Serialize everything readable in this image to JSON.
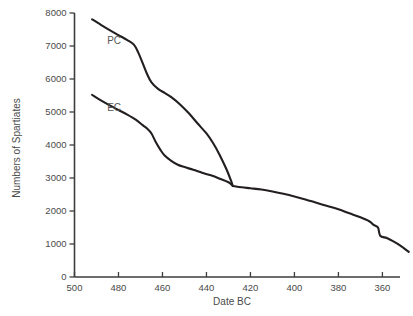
{
  "chart_data": {
    "type": "line",
    "title": "",
    "xlabel": "Date BC",
    "ylabel": "Numbers of Spartiates",
    "xlim": [
      500,
      352
    ],
    "ylim": [
      0,
      8000
    ],
    "x_ticks": [
      500,
      480,
      460,
      440,
      420,
      400,
      380,
      360
    ],
    "y_ticks": [
      0,
      1000,
      2000,
      3000,
      4000,
      5000,
      6000,
      7000,
      8000
    ],
    "x_tick_labels": [
      "500",
      "480",
      "460",
      "440",
      "420",
      "400",
      "380",
      "360"
    ],
    "y_tick_labels": [
      "0",
      "1000",
      "2000",
      "3000",
      "4000",
      "5000",
      "6000",
      "7000",
      "8000"
    ],
    "x_axis_reversed": true,
    "grid": false,
    "legend": "inline-labels",
    "series": [
      {
        "name": "PC",
        "label": "PC",
        "label_x": 482,
        "label_y": 7050,
        "color": "#231f20",
        "points": [
          [
            492,
            7810
          ],
          [
            488,
            7640
          ],
          [
            484,
            7480
          ],
          [
            480,
            7330
          ],
          [
            476,
            7180
          ],
          [
            473,
            7040
          ],
          [
            471,
            6800
          ],
          [
            469,
            6480
          ],
          [
            467,
            6150
          ],
          [
            465,
            5900
          ],
          [
            462,
            5700
          ],
          [
            459,
            5580
          ],
          [
            456,
            5450
          ],
          [
            452,
            5230
          ],
          [
            448,
            4960
          ],
          [
            444,
            4650
          ],
          [
            440,
            4350
          ],
          [
            437,
            4060
          ],
          [
            434,
            3700
          ],
          [
            431,
            3280
          ],
          [
            429,
            2950
          ],
          [
            428,
            2760
          ]
        ]
      },
      {
        "name": "EC",
        "label": "EC",
        "label_x": 482,
        "label_y": 5030,
        "color": "#231f20",
        "points": [
          [
            492,
            5520
          ],
          [
            488,
            5350
          ],
          [
            484,
            5200
          ],
          [
            480,
            5060
          ],
          [
            476,
            4920
          ],
          [
            472,
            4760
          ],
          [
            469,
            4600
          ],
          [
            467,
            4500
          ],
          [
            465,
            4350
          ],
          [
            463,
            4080
          ],
          [
            461,
            3860
          ],
          [
            459,
            3680
          ],
          [
            456,
            3520
          ],
          [
            453,
            3400
          ],
          [
            450,
            3330
          ],
          [
            446,
            3250
          ],
          [
            442,
            3160
          ],
          [
            438,
            3080
          ],
          [
            434,
            2980
          ],
          [
            430,
            2870
          ],
          [
            428,
            2760
          ]
        ]
      },
      {
        "name": "Combined",
        "label": "",
        "color": "#231f20",
        "points": [
          [
            428,
            2760
          ],
          [
            424,
            2720
          ],
          [
            420,
            2690
          ],
          [
            415,
            2650
          ],
          [
            410,
            2590
          ],
          [
            405,
            2520
          ],
          [
            400,
            2440
          ],
          [
            395,
            2350
          ],
          [
            390,
            2250
          ],
          [
            385,
            2150
          ],
          [
            380,
            2050
          ],
          [
            375,
            1930
          ],
          [
            370,
            1810
          ],
          [
            366,
            1690
          ],
          [
            364,
            1580
          ],
          [
            362,
            1500
          ],
          [
            361,
            1250
          ],
          [
            358,
            1180
          ],
          [
            355,
            1080
          ],
          [
            352,
            960
          ],
          [
            350,
            860
          ],
          [
            348,
            760
          ]
        ]
      }
    ],
    "annotations": [
      {
        "text": "PC",
        "x": 482,
        "y": 7050
      },
      {
        "text": "EC",
        "x": 482,
        "y": 5030
      }
    ]
  }
}
